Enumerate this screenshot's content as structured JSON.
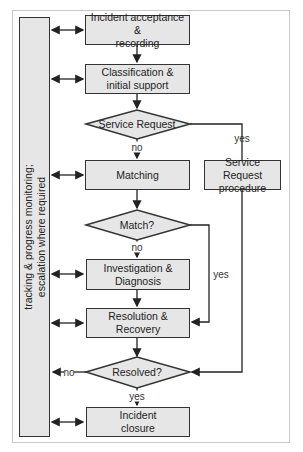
{
  "sidebar": {
    "line1": "tracking & progress monitoring;",
    "line2": "escalation where required"
  },
  "steps": {
    "acceptance": {
      "line1": "Incident acceptance &",
      "line2": "recording"
    },
    "classification": {
      "line1": "Classification &",
      "line2": "initial support"
    },
    "service_request_decision": "Service Request",
    "matching": "Matching",
    "service_request_procedure": {
      "line1": "Service Request",
      "line2": "procedure"
    },
    "match_decision": "Match?",
    "investigation": {
      "line1": "Investigation &",
      "line2": "Diagnosis"
    },
    "resolution": {
      "line1": "Resolution &",
      "line2": "Recovery"
    },
    "resolved_decision": "Resolved?",
    "closure": {
      "line1": "Incident",
      "line2": "closure"
    }
  },
  "labels": {
    "sr_yes": "yes",
    "sr_no": "no",
    "match_no": "no",
    "match_yes": "yes",
    "resolved_no": "no",
    "resolved_yes": "yes"
  },
  "colors": {
    "box_fill": "#e6e6e6",
    "stroke": "#333333"
  }
}
